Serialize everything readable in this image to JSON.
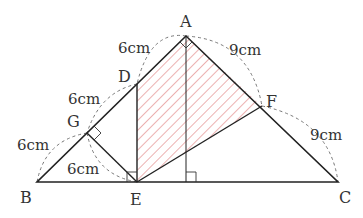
{
  "figure": {
    "type": "geometry-diagram",
    "points": {
      "A": {
        "label": "A",
        "x": 186,
        "y": 36
      },
      "B": {
        "label": "B",
        "x": 37,
        "y": 182
      },
      "C": {
        "label": "C",
        "x": 338,
        "y": 182
      },
      "D": {
        "label": "D",
        "x": 137,
        "y": 84
      },
      "E": {
        "label": "E",
        "x": 137,
        "y": 182
      },
      "F": {
        "label": "F",
        "x": 262,
        "y": 106
      },
      "G": {
        "label": "G",
        "x": 87,
        "y": 133
      },
      "H": {
        "label": "",
        "x": 186,
        "y": 182
      }
    },
    "measures": [
      {
        "text": "6cm",
        "segment": "AD"
      },
      {
        "text": "6cm",
        "segment": "DG"
      },
      {
        "text": "6cm",
        "segment": "GB"
      },
      {
        "text": "6cm",
        "segment": "GE"
      },
      {
        "text": "9cm",
        "segment": "AF"
      },
      {
        "text": "9cm",
        "segment": "FC"
      }
    ],
    "shaded_region": "ADEF",
    "colors": {
      "line": "#222222",
      "hatch": "#e07b7b",
      "dash": "#777777"
    }
  }
}
